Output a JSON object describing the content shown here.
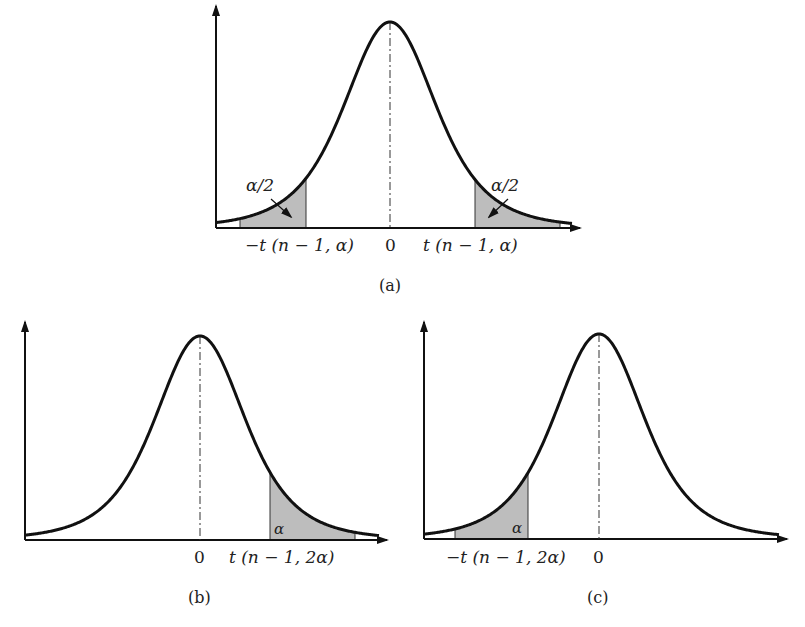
{
  "figure": {
    "fill_color": "#bdbdbd",
    "stroke_color": "#111111",
    "panels": [
      {
        "id": "a",
        "caption": "(a)",
        "tail_labels": [
          "α/2",
          "α/2"
        ],
        "tick_labels": [
          "−t (n − 1, α)",
          "0",
          "t (n − 1, α)"
        ],
        "shaded": "two-tailed"
      },
      {
        "id": "b",
        "caption": "(b)",
        "tail_labels": [
          "α"
        ],
        "tick_labels": [
          "0",
          "t (n − 1, 2α)"
        ],
        "shaded": "right-tailed"
      },
      {
        "id": "c",
        "caption": "(c)",
        "tail_labels": [
          "α"
        ],
        "tick_labels": [
          "−t (n − 1, 2α)",
          "0"
        ],
        "shaded": "left-tailed"
      }
    ]
  }
}
